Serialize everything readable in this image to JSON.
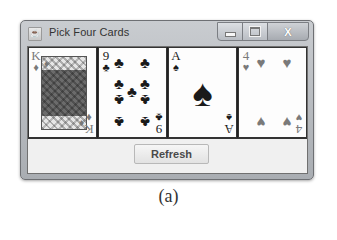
{
  "window": {
    "title": "Pick Four Cards",
    "icon": "java-app-icon",
    "controls": {
      "minimize": "minimize-icon",
      "maximize": "maximize-icon",
      "close_glyph": "X"
    }
  },
  "cards": [
    {
      "rank": "K",
      "suit": "♦",
      "suit_name": "diamonds",
      "color": "red",
      "type": "face"
    },
    {
      "rank": "9",
      "suit": "♣",
      "suit_name": "clubs",
      "color": "black",
      "type": "pips"
    },
    {
      "rank": "A",
      "suit": "♠",
      "suit_name": "spades",
      "color": "black",
      "type": "ace"
    },
    {
      "rank": "4",
      "suit": "♥",
      "suit_name": "hearts",
      "color": "red",
      "type": "pips"
    }
  ],
  "button": {
    "refresh_label": "Refresh"
  },
  "caption": "(a)",
  "colors": {
    "window_frame": "#b0b4b9",
    "client_bg": "#f0f0f0",
    "card_bg": "#fdfdfd",
    "card_border": "#333333"
  }
}
